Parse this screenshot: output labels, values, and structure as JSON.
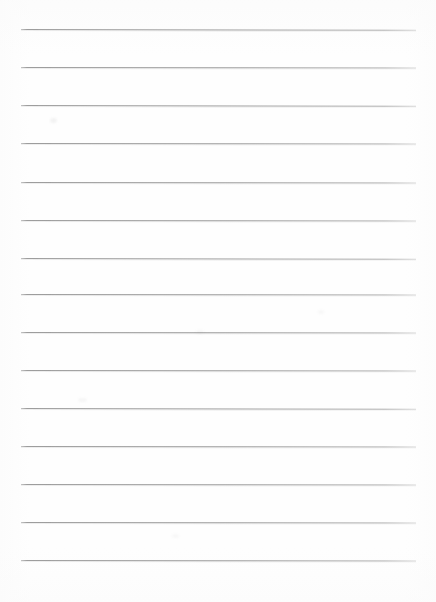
{
  "document": {
    "type": "ruled-paper",
    "title": "Blank Ruled Notebook Paper",
    "description": "A blank scanned sheet of lined writing paper with no text content.",
    "page_width_px": 436,
    "page_height_px": 602,
    "background_color": "#fefefe",
    "content_text": ""
  },
  "ruling": {
    "line_count": 14,
    "line_color": "#a2a2a2",
    "line_thickness_px": 1,
    "first_line_y_px": 29,
    "last_line_y_px": 560,
    "line_spacing_px": 38.2,
    "line_start_x_px": 21,
    "line_end_x_px": 416,
    "line_length_px": 395,
    "left_margin_px": 21,
    "right_margin_px": 20,
    "top_margin_px": 29,
    "bottom_margin_px": 42,
    "margin_rule_present": false,
    "holes_present": false,
    "lines": [
      {
        "index": 1,
        "y": 29,
        "tilt_deg": 0.1
      },
      {
        "index": 2,
        "y": 67,
        "tilt_deg": 0.08
      },
      {
        "index": 3,
        "y": 105,
        "tilt_deg": 0.1
      },
      {
        "index": 4,
        "y": 143,
        "tilt_deg": 0.07
      },
      {
        "index": 5,
        "y": 182,
        "tilt_deg": 0.09
      },
      {
        "index": 6,
        "y": 220,
        "tilt_deg": 0.08
      },
      {
        "index": 7,
        "y": 258,
        "tilt_deg": 0.1
      },
      {
        "index": 8,
        "y": 294,
        "tilt_deg": 0.07
      },
      {
        "index": 9,
        "y": 332,
        "tilt_deg": 0.09
      },
      {
        "index": 10,
        "y": 370,
        "tilt_deg": 0.08
      },
      {
        "index": 11,
        "y": 408,
        "tilt_deg": 0.1
      },
      {
        "index": 12,
        "y": 446,
        "tilt_deg": 0.07
      },
      {
        "index": 13,
        "y": 484,
        "tilt_deg": 0.09
      },
      {
        "index": 14,
        "y": 522,
        "tilt_deg": 0.08
      },
      {
        "index": 15,
        "y": 560,
        "tilt_deg": 0.09
      }
    ]
  },
  "artifacts": [
    {
      "name": "smudge-upper-left",
      "x": 50,
      "y": 118,
      "w": 7,
      "h": 5,
      "opacity": 0.1
    },
    {
      "name": "smudge-mid-left",
      "x": 78,
      "y": 398,
      "w": 9,
      "h": 4,
      "opacity": 0.07
    },
    {
      "name": "smudge-center",
      "x": 196,
      "y": 330,
      "w": 8,
      "h": 4,
      "opacity": 0.06
    },
    {
      "name": "smudge-right",
      "x": 318,
      "y": 310,
      "w": 6,
      "h": 4,
      "opacity": 0.06
    },
    {
      "name": "smudge-lower",
      "x": 172,
      "y": 534,
      "w": 7,
      "h": 4,
      "opacity": 0.06
    }
  ]
}
